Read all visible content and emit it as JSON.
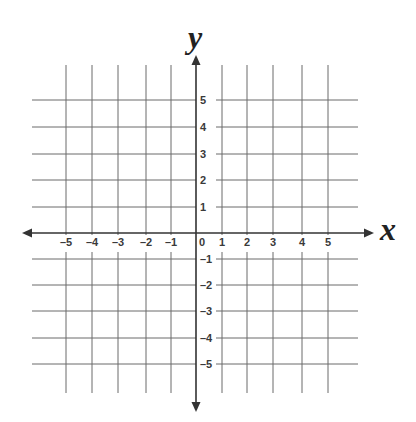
{
  "diagram": {
    "type": "coordinate-plane",
    "x_axis": {
      "label": "x",
      "ticks": [
        -5,
        -4,
        -3,
        -2,
        -1,
        0,
        1,
        2,
        3,
        4,
        5
      ],
      "tick_labels": [
        "–5",
        "–4",
        "–3",
        "–2",
        "–1",
        "0",
        "1",
        "2",
        "3",
        "4",
        "5"
      ]
    },
    "y_axis": {
      "label": "y",
      "ticks": [
        5,
        4,
        3,
        2,
        1,
        -1,
        -2,
        -3,
        -4,
        -5
      ],
      "tick_labels": [
        "5",
        "4",
        "3",
        "2",
        "1",
        "–1",
        "–2",
        "–3",
        "–4",
        "–5"
      ]
    },
    "grid": {
      "min": -6,
      "max": 6,
      "step": 1
    },
    "colors": {
      "grid": "#6b6b6b",
      "axis": "#333333",
      "label": "#3a3a3a"
    }
  }
}
